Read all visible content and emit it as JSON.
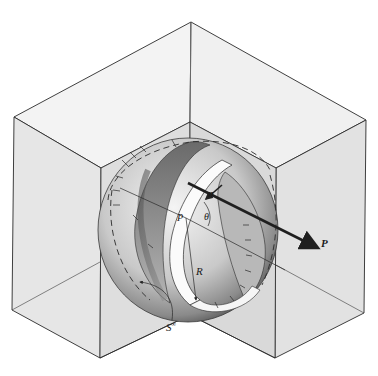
{
  "figure": {
    "type": "engineering illustration",
    "labels": {
      "normal": "n",
      "angle": "θ",
      "point": "P",
      "radius": "R",
      "surface": "S",
      "surface_sup": "∞",
      "force": "P"
    },
    "colors": {
      "line": "#2a2a2a",
      "face_light": "#ececec",
      "face_mid": "#dcdcdc",
      "sphere_dark": "#6e6e6e",
      "sphere_mid": "#a8a8a8",
      "band_dark": "#555555",
      "background": "#ffffff"
    }
  }
}
